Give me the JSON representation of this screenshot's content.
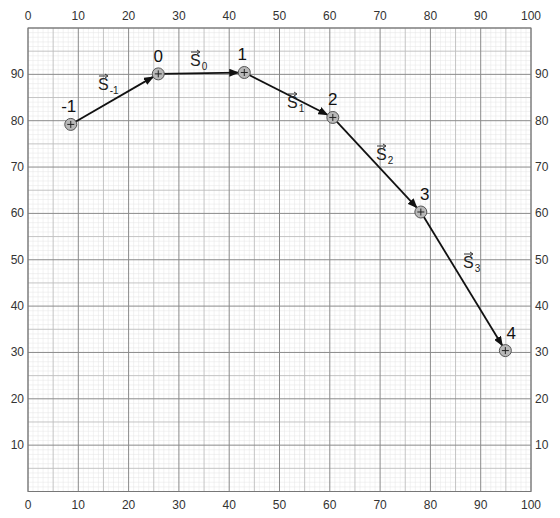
{
  "chart_data": {
    "type": "line",
    "title": "",
    "xlabel": "",
    "ylabel": "",
    "xlim": [
      0,
      100
    ],
    "ylim": [
      0,
      100
    ],
    "grid": true,
    "x_ticks": [
      0,
      10,
      20,
      30,
      40,
      50,
      60,
      70,
      80,
      90,
      100
    ],
    "y_ticks": [
      10,
      20,
      30,
      40,
      50,
      60,
      70,
      80,
      90
    ],
    "x_tick_labels_top": [
      "0",
      "10",
      "20",
      "30",
      "40",
      "50",
      "60",
      "70",
      "80",
      "90",
      "100"
    ],
    "x_tick_labels_bottom": [
      "0",
      "10",
      "20",
      "30",
      "40",
      "50",
      "60",
      "70",
      "80",
      "90",
      "100"
    ],
    "y_tick_labels_left": [
      "10",
      "20",
      "30",
      "40",
      "50",
      "60",
      "70",
      "80",
      "90"
    ],
    "y_tick_labels_right": [
      "10",
      "20",
      "30",
      "40",
      "50",
      "60",
      "70",
      "80",
      "90"
    ],
    "points": [
      {
        "label": "-1",
        "x": 8.5,
        "y": 79.2
      },
      {
        "label": "0",
        "x": 25.9,
        "y": 90.1
      },
      {
        "label": "1",
        "x": 43.0,
        "y": 90.4
      },
      {
        "label": "2",
        "x": 60.6,
        "y": 80.7
      },
      {
        "label": "3",
        "x": 78.1,
        "y": 60.3
      },
      {
        "label": "4",
        "x": 94.9,
        "y": 30.4
      }
    ],
    "vectors": [
      {
        "name": "S",
        "sub": "-1",
        "from": "-1",
        "to": "0"
      },
      {
        "name": "S",
        "sub": "0",
        "from": "0",
        "to": "1"
      },
      {
        "name": "S",
        "sub": "1",
        "from": "1",
        "to": "2"
      },
      {
        "name": "S",
        "sub": "2",
        "from": "2",
        "to": "3"
      },
      {
        "name": "S",
        "sub": "3",
        "from": "3",
        "to": "4"
      }
    ]
  },
  "style": {
    "line_color": "#111111",
    "marker_fill": "#b8b8b8",
    "marker_stroke": "#555555",
    "major_grid": "#8a8a8a",
    "mid_grid": "#bdbdbd",
    "minor_grid": "#e4e4e4"
  }
}
